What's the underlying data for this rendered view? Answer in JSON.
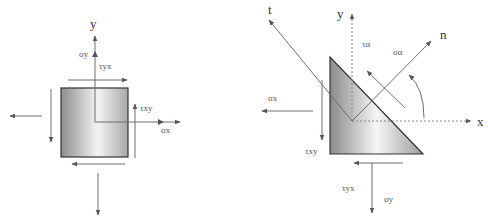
{
  "colors": {
    "line": "#6e6e6e",
    "dark_line": "#333333",
    "fill_dark": "#8e8e8e",
    "fill_light": "#f4f4f4",
    "text": "#555555"
  },
  "left_diagram": {
    "title": "stress element",
    "labels": {
      "y_axis": "y",
      "x_axis": "x",
      "sigma_y": "σy",
      "tau_yx": "τyx",
      "tau_xy": "τxy",
      "sigma_x": "σx"
    },
    "square": {
      "x": 61,
      "y": 88,
      "w": 67,
      "h": 69
    },
    "origin": [
      95,
      122
    ]
  },
  "right_diagram": {
    "title": "inclined section element",
    "labels": {
      "t_axis": "t",
      "y_axis": "y",
      "n_axis": "n",
      "x_axis": "x",
      "tau_alpha": "τα",
      "sigma_alpha": "σα",
      "sigma_x": "σx",
      "tau_xy": "τxy",
      "tau_yx": "τyx",
      "sigma_y": "σy"
    },
    "triangle": [
      [
        330,
        57
      ],
      [
        330,
        154
      ],
      [
        423,
        154
      ]
    ],
    "origin": [
      352,
      121
    ]
  }
}
